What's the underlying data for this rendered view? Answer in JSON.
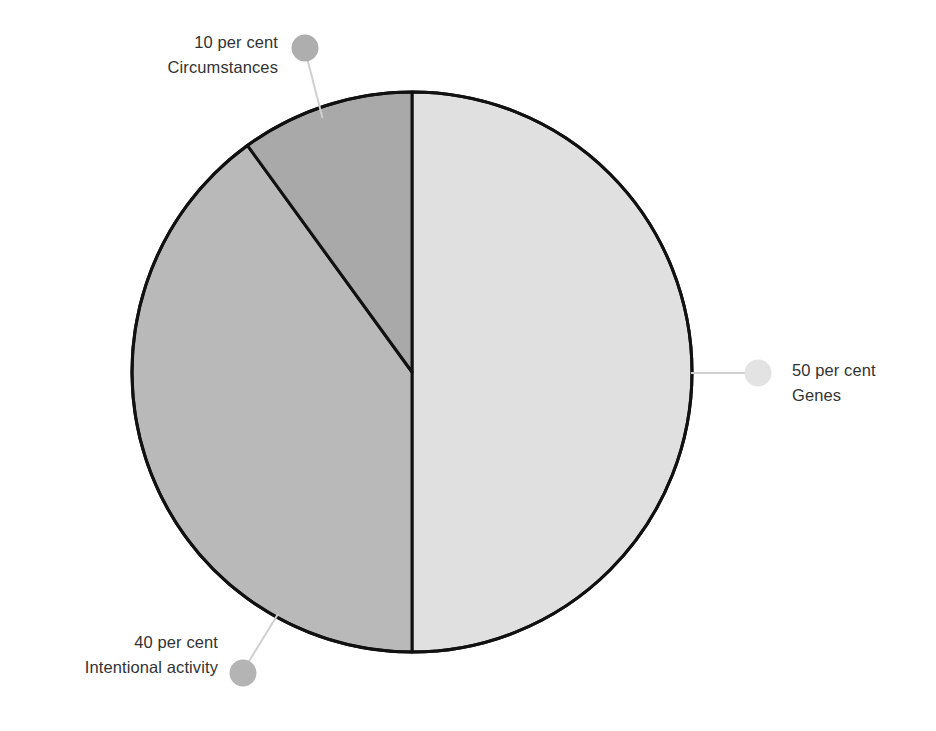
{
  "chart_data": {
    "type": "pie",
    "title": "",
    "subtitle": "",
    "xlabel": "",
    "ylabel": "",
    "legend_position": "callout-labels",
    "grid": false,
    "total": 100,
    "unit": "per cent",
    "start_angle_deg": 0,
    "direction": "clockwise",
    "categories": [
      "Genes",
      "Intentional activity",
      "Circumstances"
    ],
    "values": [
      50,
      40,
      10
    ],
    "slices": [
      {
        "name": "Genes",
        "value": 50,
        "value_text": "50 per cent",
        "label_text": "Genes",
        "color": "#e0e0e0",
        "marker_color": "#e3e3e3",
        "start_deg": 0,
        "end_deg": 180
      },
      {
        "name": "Intentional activity",
        "value": 40,
        "value_text": "40 per cent",
        "label_text": "Intentional activity",
        "color": "#b9b9b9",
        "marker_color": "#b4b4b4",
        "start_deg": 180,
        "end_deg": 324
      },
      {
        "name": "Circumstances",
        "value": 10,
        "value_text": "10 per cent",
        "label_text": "Circumstances",
        "color": "#a9a9a9",
        "marker_color": "#aeaeae",
        "start_deg": 324,
        "end_deg": 360
      }
    ]
  },
  "style": {
    "background": "#ffffff",
    "outline_color": "#111111",
    "outline_width": 3,
    "leader_color": "#cfcfcf",
    "text_color": "#333333"
  },
  "geometry": {
    "center_x": 412,
    "center_y": 372,
    "radius": 280
  }
}
